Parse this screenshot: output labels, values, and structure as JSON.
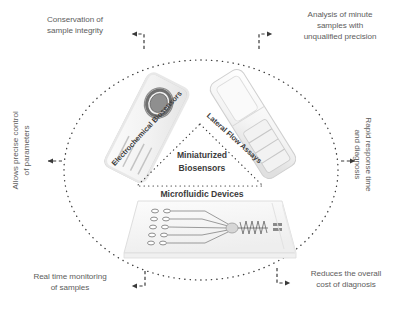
{
  "diagram": {
    "core": {
      "center_label_line1": "Miniaturized",
      "center_label_line2": "Biosensors",
      "bottom_label": "Microfluidic Devices"
    },
    "technologies": [
      {
        "name": "electrochemical-biosensors",
        "label": "Electrochemical Biosensors"
      },
      {
        "name": "lateral-flow-assays",
        "label": "Lateral Flow Assays"
      },
      {
        "name": "microfluidic-devices",
        "label": "Microfluidic Devices"
      }
    ],
    "benefits": [
      {
        "name": "conservation-of-sample-integrity",
        "position": "top-left",
        "lines": [
          "Conservation of",
          "sample integrity"
        ],
        "arrow": "left"
      },
      {
        "name": "analysis-of-minute-samples",
        "position": "top-right",
        "lines": [
          "Analysis of minute",
          "samples with",
          "unqualified precision"
        ],
        "arrow": "right"
      },
      {
        "name": "allows-precise-control-of-parameters",
        "position": "left",
        "lines": [
          "Allows precise control",
          "of parameters"
        ],
        "arrow": "left"
      },
      {
        "name": "rapid-response-time-and-diagnosis",
        "position": "right",
        "lines": [
          "Rapid response time",
          "and diagnosis"
        ],
        "arrow": "right"
      },
      {
        "name": "real-time-monitoring-of-samples",
        "position": "bottom-left",
        "lines": [
          "Real time monitoring",
          "of samples"
        ],
        "arrow": "left"
      },
      {
        "name": "reduces-the-overall-cost-of-diagnosis",
        "position": "bottom-right",
        "lines": [
          "Reduces the overall",
          "cost of diagnosis"
        ],
        "arrow": "right"
      }
    ],
    "colors": {
      "text_gray": "#5d5d5d",
      "text_dark": "#3b3b3b",
      "dotted_circle": "#3d3d3d",
      "device_outline": "#c9c9c9",
      "electrode_dark": "#6f6f6f",
      "background": "#ffffff"
    }
  }
}
